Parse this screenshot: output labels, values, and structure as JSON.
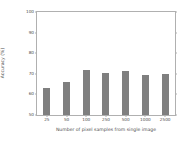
{
  "chart_data": {
    "type": "bar",
    "title": "",
    "xlabel": "Number of pixel samples from single image",
    "ylabel": "Accuracy (%)",
    "categories": [
      "25",
      "50",
      "100",
      "250",
      "500",
      "1000",
      "2500"
    ],
    "values": [
      63,
      66,
      72,
      70.5,
      71.5,
      69.5,
      70
    ],
    "ylim": [
      50,
      100
    ],
    "yticks": [
      "100",
      "90",
      "80",
      "70",
      "60",
      "50"
    ],
    "ytick_values": [
      100,
      90,
      80,
      70,
      60,
      50
    ],
    "grid": false,
    "legend": null,
    "bar_color": "#7f7f7f",
    "axis_color": "#b0b0b0",
    "text_color": "#4d4d4d"
  }
}
